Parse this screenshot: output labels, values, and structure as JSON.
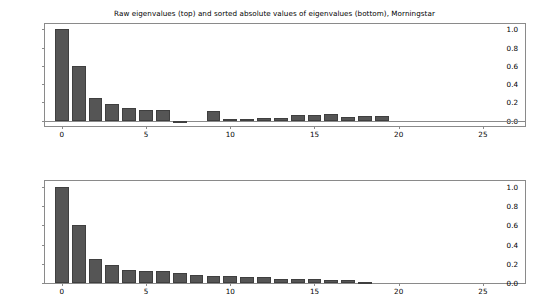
{
  "figure": {
    "title": "Raw eigenvalues (top) and sorted absolute values of eigenvalues (bottom), Morningstar",
    "background_color": "#ffffff",
    "bar_color": "#555555",
    "bar_edge_color": "#3f3f3f",
    "axis_color": "#8a8a8a"
  },
  "chart_data": [
    {
      "type": "bar",
      "panel": "top",
      "title": "Raw eigenvalues (top)",
      "xlabel": "",
      "ylabel": "",
      "xlim": [
        -1.0,
        27.5
      ],
      "ylim": [
        -0.06,
        1.06
      ],
      "grid": false,
      "legend": null,
      "xticks": [
        0,
        5,
        10,
        15,
        20,
        25
      ],
      "xticklabels": [
        "0",
        "5",
        "10",
        "15",
        "20",
        "25"
      ],
      "yticks": [
        0.0,
        0.2,
        0.4,
        0.6,
        0.8,
        1.0
      ],
      "yticklabels": [
        "0.0",
        "0.2",
        "0.4",
        "0.6",
        "0.8",
        "1.0"
      ],
      "categories": [
        0,
        1,
        2,
        3,
        4,
        5,
        6,
        7,
        8,
        9,
        10,
        11,
        12,
        13,
        14,
        15,
        16,
        17,
        18,
        19
      ],
      "values": [
        1.0,
        0.6,
        0.25,
        0.185,
        0.135,
        0.115,
        0.115,
        -0.01,
        0.0,
        0.105,
        0.02,
        0.02,
        0.03,
        0.03,
        0.06,
        0.06,
        0.07,
        0.04,
        0.045,
        0.045
      ]
    },
    {
      "type": "bar",
      "panel": "bottom",
      "title": "sorted absolute values of eigenvalues (bottom)",
      "xlabel": "",
      "ylabel": "",
      "xlim": [
        -1.0,
        27.5
      ],
      "ylim": [
        0.0,
        1.06
      ],
      "grid": false,
      "legend": null,
      "xticks": [
        0,
        5,
        10,
        15,
        20,
        25
      ],
      "xticklabels": [
        "0",
        "5",
        "10",
        "15",
        "20",
        "25"
      ],
      "yticks": [
        0.0,
        0.2,
        0.4,
        0.6,
        0.8,
        1.0
      ],
      "yticklabels": [
        "0.0",
        "0.2",
        "0.4",
        "0.6",
        "0.8",
        "1.0"
      ],
      "categories": [
        0,
        1,
        2,
        3,
        4,
        5,
        6,
        7,
        8,
        9,
        10,
        11,
        12,
        13,
        14,
        15,
        16,
        17,
        18
      ],
      "values": [
        1.0,
        0.6,
        0.25,
        0.19,
        0.14,
        0.125,
        0.125,
        0.105,
        0.08,
        0.075,
        0.07,
        0.06,
        0.06,
        0.045,
        0.045,
        0.04,
        0.03,
        0.03,
        0.01
      ]
    }
  ]
}
